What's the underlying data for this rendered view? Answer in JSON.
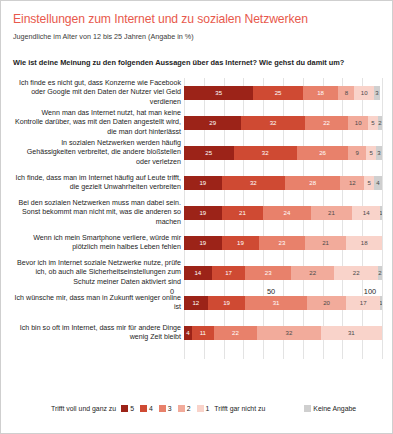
{
  "header": {
    "title": "Einstellungen zum Internet und zu sozialen Netzwerken",
    "subtitle": "Jugendliche im Alter von 12 bis 25 Jahren (Angabe in %)",
    "question": "Wie ist deine Meinung zu den folgenden Aussagen über das Internet? Wie gehst du damit um?"
  },
  "legend": {
    "left_label": "Trifft voll und ganz zu",
    "right_label": "Trifft gar nicht zu",
    "no_answer_label": "Keine Angabe",
    "items": [
      {
        "label": "5",
        "color": "#9c2318"
      },
      {
        "label": "4",
        "color": "#cf4a33"
      },
      {
        "label": "3",
        "color": "#e8816b"
      },
      {
        "label": "2",
        "color": "#f2ab9b"
      },
      {
        "label": "1",
        "color": "#f9d3ca"
      }
    ],
    "no_answer_color": "#cfcfcf"
  },
  "chart_data": {
    "type": "bar",
    "orientation": "horizontal",
    "stacked": true,
    "title": "Einstellungen zum Internet und zu sozialen Netzwerken",
    "subtitle": "Jugendliche im Alter von 12 bis 25 Jahren (Angabe in %)",
    "xlabel": "",
    "ylabel": "",
    "xlim": [
      0,
      100
    ],
    "xticks": [
      0,
      50,
      100
    ],
    "grid": true,
    "legend_position": "bottom",
    "series": [
      {
        "name": "5",
        "color": "#9c2318",
        "values": [
          35,
          29,
          25,
          19,
          19,
          19,
          14,
          12,
          4
        ]
      },
      {
        "name": "4",
        "color": "#cf4a33",
        "values": [
          25,
          32,
          32,
          32,
          21,
          19,
          17,
          19,
          11
        ]
      },
      {
        "name": "3",
        "color": "#e8816b",
        "values": [
          18,
          22,
          26,
          28,
          24,
          23,
          23,
          31,
          22
        ]
      },
      {
        "name": "2",
        "color": "#f2ab9b",
        "values": [
          8,
          10,
          9,
          12,
          21,
          21,
          22,
          20,
          32
        ]
      },
      {
        "name": "1",
        "color": "#f9d3ca",
        "values": [
          10,
          5,
          5,
          5,
          14,
          18,
          22,
          17,
          31
        ]
      },
      {
        "name": "Keine Angabe",
        "color": "#cfcfcf",
        "values": [
          3,
          2,
          3,
          4,
          1,
          0,
          2,
          1,
          0
        ]
      }
    ],
    "categories": [
      "Ich finde es nicht gut, dass Konzerne wie Facebook oder Google mit den Daten der Nutzer viel Geld verdienen",
      "Wenn man das Internet nutzt, hat man keine Kontrolle darüber, was mit den Daten angestellt wird, die man dort hinterlässt",
      "In sozialen Netzwerken werden häufig Gehässigkeiten verbreitet, die andere bloßstellen oder verletzen",
      "Ich finde, dass man im Internet häufig auf Leute trifft, die gezielt Unwahrheiten verbreiten",
      "Bei den sozialen Netzwerken muss man dabei sein. Sonst bekommt man nicht mit, was die anderen so machen",
      "Wenn ich mein Smartphone verliere, würde mir plötzlich mein halbes Leben fehlen",
      "Bevor ich im Internet soziale Netzwerke nutze, prüfe ich, ob auch alle Sicherheitseinstellungen zum Schutz meiner Daten aktiviert sind",
      "Ich wünsche mir, dass man in Zukunft weniger online ist",
      "Ich bin so oft im Internet, dass mir für andere Dinge wenig Zeit bleibt"
    ]
  }
}
